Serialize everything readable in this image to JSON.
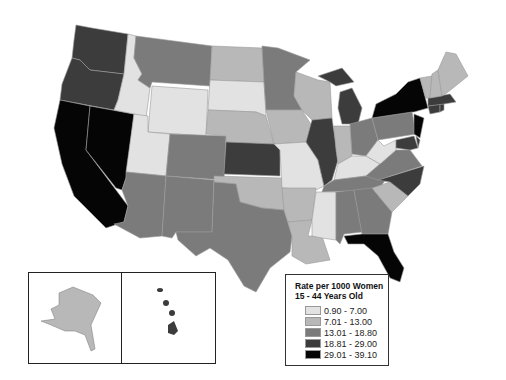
{
  "legend": {
    "title_line1": "Rate per 1000 Women",
    "title_line2": "15 - 44 Years Old",
    "classes": [
      {
        "label": "0.90 - 7.00",
        "color": "#e2e2e2"
      },
      {
        "label": "7.01 - 13.00",
        "color": "#b8b8b8"
      },
      {
        "label": "13.01 - 18.80",
        "color": "#7b7b7b"
      },
      {
        "label": "18.81 - 29.00",
        "color": "#3c3c3c"
      },
      {
        "label": "29.01 - 39.10",
        "color": "#050505"
      }
    ]
  },
  "insets": [
    {
      "name": "Alaska",
      "class": "7.01 - 13.00"
    },
    {
      "name": "Hawaii",
      "class": "18.81 - 29.00"
    }
  ],
  "states": {
    "WA": "18.81 - 29.00",
    "OR": "18.81 - 29.00",
    "CA": "29.01 - 39.10",
    "NV": "29.01 - 39.10",
    "ID": "0.90 - 7.00",
    "MT": "13.01 - 18.80",
    "WY": "0.90 - 7.00",
    "UT": "0.90 - 7.00",
    "AZ": "13.01 - 18.80",
    "CO": "13.01 - 18.80",
    "NM": "13.01 - 18.80",
    "TX": "13.01 - 18.80",
    "ND": "7.01 - 13.00",
    "SD": "0.90 - 7.00",
    "NE": "7.01 - 13.00",
    "KS": "18.81 - 29.00",
    "OK": "7.01 - 13.00",
    "MN": "13.01 - 18.80",
    "IA": "7.01 - 13.00",
    "MO": "0.90 - 7.00",
    "AR": "7.01 - 13.00",
    "LA": "7.01 - 13.00",
    "WI": "7.01 - 13.00",
    "IL": "18.81 - 29.00",
    "MI": "18.81 - 29.00",
    "IN": "7.01 - 13.00",
    "OH": "13.01 - 18.80",
    "KY": "0.90 - 7.00",
    "TN": "13.01 - 18.80",
    "MS": "0.90 - 7.00",
    "AL": "13.01 - 18.80",
    "GA": "13.01 - 18.80",
    "FL": "29.01 - 39.10",
    "SC": "7.01 - 13.00",
    "NC": "18.81 - 29.00",
    "VA": "13.01 - 18.80",
    "WV": "0.90 - 7.00",
    "PA": "13.01 - 18.80",
    "NY": "29.01 - 39.10",
    "NJ": "29.01 - 39.10",
    "MD": "18.81 - 29.00",
    "DE": "18.81 - 29.00",
    "CT": "18.81 - 29.00",
    "RI": "18.81 - 29.00",
    "MA": "18.81 - 29.00",
    "VT": "7.01 - 13.00",
    "NH": "7.01 - 13.00",
    "ME": "7.01 - 13.00"
  }
}
